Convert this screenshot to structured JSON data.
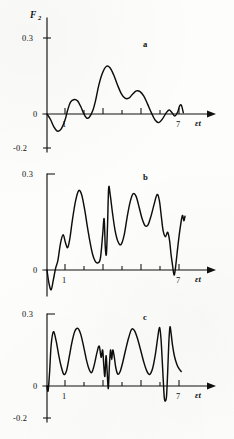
{
  "figure": {
    "ylabel": "F",
    "ylabel_subscript": "2",
    "xlabel": "εt",
    "background_color": "#fdfdfb",
    "ink_color": "#0d0d0d"
  },
  "chart_data": [
    {
      "type": "line",
      "panel": "a",
      "title": "a",
      "xlabel": "εt",
      "ylabel": "F₂",
      "xlim": [
        0,
        9.6
      ],
      "ylim": [
        -0.2,
        0.3
      ],
      "xticks": [
        1,
        2,
        3,
        4,
        5,
        6,
        7
      ],
      "xtick_labels": [
        "1",
        "",
        "",
        "",
        "",
        "",
        "7"
      ],
      "yticks": [
        -0.2,
        0,
        0.3
      ],
      "ytick_labels": [
        "-0.2",
        "0",
        "0.3"
      ],
      "grid": false,
      "legend": "none",
      "series": [
        {
          "name": "F2(a)",
          "x": [
            0.0,
            0.18,
            0.36,
            0.55,
            0.75,
            0.95,
            1.1,
            1.25,
            1.45,
            1.62,
            1.8,
            1.95,
            2.1,
            2.25,
            2.42,
            2.58,
            2.75,
            2.95,
            3.15,
            3.35,
            3.55,
            3.75,
            3.95,
            4.15,
            4.35,
            4.55,
            4.75,
            4.95,
            5.15,
            5.35,
            5.55,
            5.75,
            5.95,
            6.15,
            6.35,
            6.5,
            6.65,
            6.8,
            6.95,
            7.05,
            7.15,
            7.25
          ],
          "y": [
            0.0,
            -0.016,
            -0.038,
            -0.052,
            -0.046,
            -0.02,
            0.012,
            0.036,
            0.044,
            0.04,
            0.022,
            0.002,
            -0.012,
            -0.01,
            0.008,
            0.04,
            0.086,
            0.124,
            0.144,
            0.14,
            0.118,
            0.088,
            0.062,
            0.048,
            0.048,
            0.06,
            0.07,
            0.068,
            0.054,
            0.03,
            0.004,
            -0.018,
            -0.026,
            -0.014,
            0.004,
            0.012,
            0.004,
            -0.006,
            0.006,
            0.024,
            0.026,
            0.004
          ]
        }
      ]
    },
    {
      "type": "line",
      "panel": "b",
      "title": "b",
      "xlabel": "εt",
      "ylabel": "F₂",
      "xlim": [
        0,
        9.6
      ],
      "ylim": [
        -0.2,
        0.3
      ],
      "xticks": [
        1,
        2,
        3,
        4,
        5,
        6,
        7
      ],
      "xtick_labels": [
        "1",
        "",
        "",
        "",
        "",
        "",
        "7"
      ],
      "yticks": [
        0,
        0.3
      ],
      "ytick_labels": [
        "0",
        "0.3"
      ],
      "grid": false,
      "legend": "none",
      "series": [
        {
          "name": "F2(b)",
          "x": [
            0.0,
            0.1,
            0.22,
            0.34,
            0.46,
            0.58,
            0.72,
            0.86,
            0.98,
            1.1,
            1.22,
            1.36,
            1.52,
            1.68,
            1.84,
            2.0,
            2.14,
            2.28,
            2.42,
            2.56,
            2.7,
            2.84,
            2.96,
            3.04,
            3.1,
            3.16,
            3.22,
            3.28,
            3.36,
            3.48,
            3.62,
            3.78,
            3.94,
            4.1,
            4.26,
            4.42,
            4.58,
            4.74,
            4.9,
            5.06,
            5.22,
            5.38,
            5.54,
            5.7,
            5.86,
            5.98,
            6.08,
            6.18,
            6.3,
            6.42,
            6.52,
            6.6,
            6.68,
            6.76,
            6.84,
            6.96,
            7.08,
            7.2,
            7.28,
            7.34
          ],
          "y": [
            0.0,
            -0.04,
            -0.062,
            -0.03,
            0.006,
            0.03,
            0.084,
            0.11,
            0.086,
            0.07,
            0.1,
            0.16,
            0.216,
            0.248,
            0.236,
            0.19,
            0.138,
            0.09,
            0.05,
            0.028,
            0.022,
            0.036,
            0.11,
            0.16,
            0.072,
            0.05,
            0.14,
            0.256,
            0.236,
            0.18,
            0.124,
            0.088,
            0.08,
            0.108,
            0.164,
            0.212,
            0.238,
            0.23,
            0.196,
            0.16,
            0.138,
            0.142,
            0.17,
            0.206,
            0.236,
            0.216,
            0.168,
            0.122,
            0.104,
            0.118,
            0.092,
            0.048,
            0.014,
            -0.016,
            0.01,
            0.074,
            0.13,
            0.17,
            0.154,
            0.168
          ]
        }
      ]
    },
    {
      "type": "line",
      "panel": "c",
      "title": "c",
      "xlabel": "εt",
      "ylabel": "F₂",
      "xlim": [
        0,
        9.6
      ],
      "ylim": [
        -0.2,
        0.3
      ],
      "xticks": [
        1,
        2,
        3,
        4,
        5,
        6,
        7
      ],
      "xtick_labels": [
        "1",
        "",
        "",
        "",
        "",
        "",
        "7"
      ],
      "yticks": [
        -0.2,
        0,
        0.3
      ],
      "ytick_labels": [
        "-0.2",
        "0",
        "0.3"
      ],
      "grid": false,
      "legend": "none",
      "series": [
        {
          "name": "F2(c)",
          "x": [
            0.0,
            0.06,
            0.14,
            0.22,
            0.34,
            0.48,
            0.62,
            0.76,
            0.9,
            1.04,
            1.18,
            1.32,
            1.48,
            1.64,
            1.8,
            1.96,
            2.1,
            2.24,
            2.38,
            2.52,
            2.66,
            2.78,
            2.88,
            2.96,
            3.02,
            3.08,
            3.14,
            3.2,
            3.26,
            3.32,
            3.38,
            3.44,
            3.5,
            3.58,
            3.66,
            3.76,
            3.88,
            4.02,
            4.18,
            4.34,
            4.5,
            4.66,
            4.82,
            4.98,
            5.14,
            5.3,
            5.46,
            5.62,
            5.76,
            5.88,
            5.98,
            6.06,
            6.12,
            6.18,
            6.24,
            6.3,
            6.36,
            6.42,
            6.48,
            6.54,
            6.6,
            6.68,
            6.78,
            6.9,
            7.02,
            7.14
          ],
          "y": [
            0.0,
            -0.02,
            0.06,
            0.17,
            0.226,
            0.19,
            0.13,
            0.08,
            0.048,
            0.064,
            0.12,
            0.18,
            0.228,
            0.24,
            0.214,
            0.16,
            0.108,
            0.07,
            0.056,
            0.09,
            0.14,
            0.166,
            0.12,
            0.15,
            0.086,
            0.04,
            0.126,
            0.06,
            -0.01,
            0.086,
            0.15,
            0.11,
            0.15,
            0.12,
            0.076,
            0.05,
            0.058,
            0.096,
            0.15,
            0.2,
            0.236,
            0.23,
            0.196,
            0.15,
            0.102,
            0.064,
            0.048,
            0.074,
            0.13,
            0.196,
            0.244,
            0.2,
            0.12,
            0.03,
            -0.05,
            -0.062,
            -0.04,
            0.06,
            0.18,
            0.246,
            0.22,
            0.168,
            0.124,
            0.092,
            0.072,
            0.06
          ]
        }
      ]
    }
  ],
  "panels": {
    "a": {
      "letter": "a",
      "ytick_top": "0.3",
      "ytick_zero": "0",
      "ytick_bottom": "-0.2",
      "xtick_first": "1",
      "xtick_last": "7",
      "xlabel": "εt"
    },
    "b": {
      "letter": "b",
      "ytick_top": "0.3",
      "ytick_zero": "0",
      "ytick_bottom": "-0.2",
      "xtick_first": "1",
      "xtick_last": "7",
      "xlabel": "εt"
    },
    "c": {
      "letter": "c",
      "ytick_top": "0.3",
      "ytick_zero": "0",
      "ytick_bottom": "-0.2",
      "xtick_first": "1",
      "xtick_last": "7",
      "xlabel": "εt"
    }
  }
}
